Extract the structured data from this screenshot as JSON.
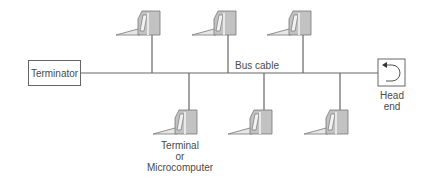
{
  "diagram": {
    "type": "bus-topology",
    "terminator_label": "Terminator",
    "bus_label": "Bus cable",
    "head_end_label_line1": "Head",
    "head_end_label_line2": "end",
    "terminal_label_line1": "Terminal",
    "terminal_label_line2": "or",
    "terminal_label_line3": "Microcomputer",
    "colors": {
      "line": "#666666",
      "terminal_fill": "#bdbdbd",
      "terminal_light": "#e6e6e6"
    },
    "nodes_upper": [
      152,
      228,
      303
    ],
    "nodes_lower": [
      189,
      264,
      340
    ]
  }
}
